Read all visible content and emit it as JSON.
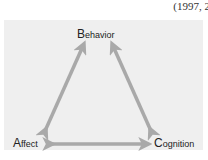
{
  "citation": "(1997, 2",
  "diagram": {
    "nodes": {
      "behavior": {
        "initial": "B",
        "rest": "ehavior"
      },
      "affect": {
        "initial": "A",
        "rest": "ffect"
      },
      "cognition": {
        "initial": "C",
        "rest": "ognition"
      }
    },
    "edges": [
      {
        "from": "affect",
        "to": "behavior",
        "bidirectional": true
      },
      {
        "from": "cognition",
        "to": "behavior",
        "bidirectional": true
      },
      {
        "from": "affect",
        "to": "cognition",
        "bidirectional": true
      }
    ],
    "colors": {
      "panel": "#efefef",
      "arrow": "#a9a9a9",
      "text": "#222222"
    }
  }
}
